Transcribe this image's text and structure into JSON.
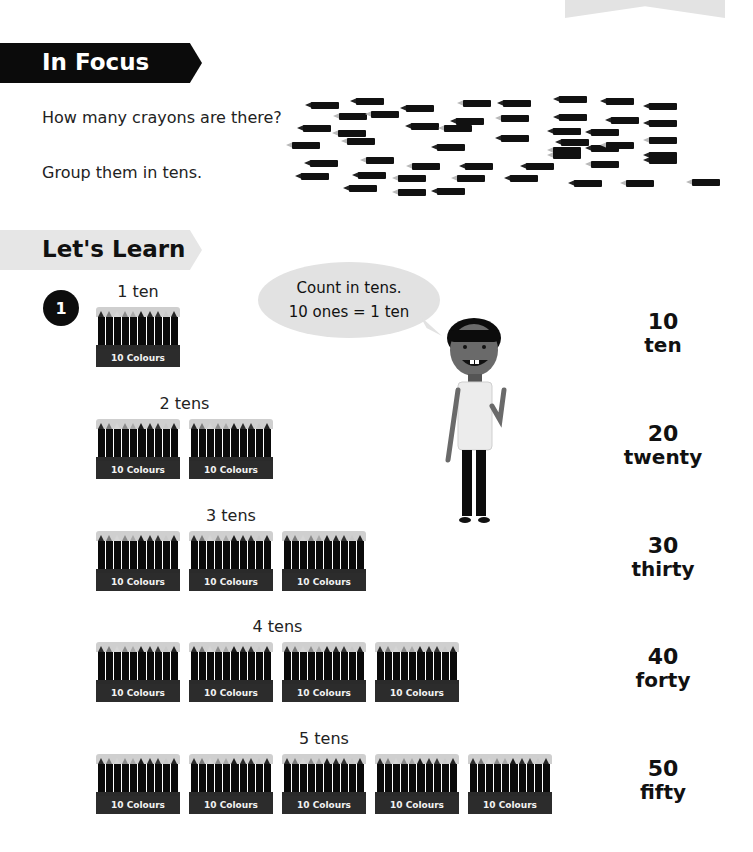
{
  "header": {
    "in_focus_title": "In Focus",
    "lets_learn_title": "Let's Learn"
  },
  "in_focus": {
    "question": "How many crayons are there?",
    "instruction": "Group them in tens.",
    "loose_crayon_count": 50
  },
  "lets_learn": {
    "step_number": "1",
    "speech_bubble": {
      "line1": "Count in tens.",
      "line2": "10 ones = 1 ten"
    },
    "box_label": "10 Colours",
    "rows": [
      {
        "label": "1 ten",
        "boxes": 1,
        "number": "10",
        "word": "ten"
      },
      {
        "label": "2 tens",
        "boxes": 2,
        "number": "20",
        "word": "twenty"
      },
      {
        "label": "3 tens",
        "boxes": 3,
        "number": "30",
        "word": "thirty"
      },
      {
        "label": "4 tens",
        "boxes": 4,
        "number": "40",
        "word": "forty"
      },
      {
        "label": "5 tens",
        "boxes": 5,
        "number": "50",
        "word": "fifty"
      }
    ]
  },
  "colors": {
    "in_focus_banner": "#0b0b0b",
    "lets_learn_banner": "#e6e6e6",
    "bubble": "#e2e2e2"
  }
}
